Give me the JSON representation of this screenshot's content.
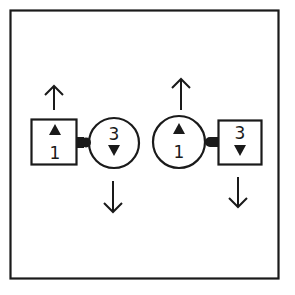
{
  "diagram": {
    "ink_color": "#1a1a1a",
    "background_color": "#ffffff",
    "groups": [
      {
        "name": "left-pair",
        "first": {
          "shape": "square",
          "digit": "1",
          "pointer": "up",
          "motion": "up"
        },
        "second": {
          "shape": "circle",
          "digit": "3",
          "pointer": "down",
          "motion": "down"
        }
      },
      {
        "name": "right-pair",
        "first": {
          "shape": "circle",
          "digit": "1",
          "pointer": "up",
          "motion": "up"
        },
        "second": {
          "shape": "square",
          "digit": "3",
          "pointer": "down",
          "motion": "down"
        }
      }
    ]
  }
}
